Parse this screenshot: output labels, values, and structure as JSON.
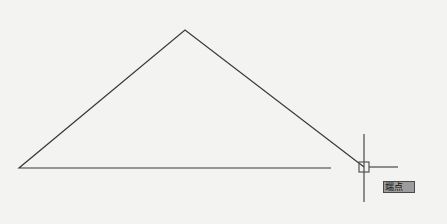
{
  "viewport": {
    "background": "#f3f3f1",
    "line_color": "#3a3a3a"
  },
  "drawing": {
    "triangle": {
      "apex": [
        185,
        30
      ],
      "left_vertex": [
        19,
        168
      ],
      "right_vertex": [
        364,
        167
      ]
    },
    "baseline": {
      "start": [
        19,
        168
      ],
      "end": [
        331,
        168
      ]
    }
  },
  "cursor": {
    "position": [
      364,
      167
    ],
    "crosshair_vertical": {
      "x": 364,
      "y1": 134,
      "y2": 202
    },
    "crosshair_horizontal": {
      "y": 167,
      "x1": 369,
      "x2": 398
    },
    "snap_marker": {
      "type": "endpoint-square",
      "size": 10
    }
  },
  "snap_tooltip": {
    "label": "端点"
  }
}
